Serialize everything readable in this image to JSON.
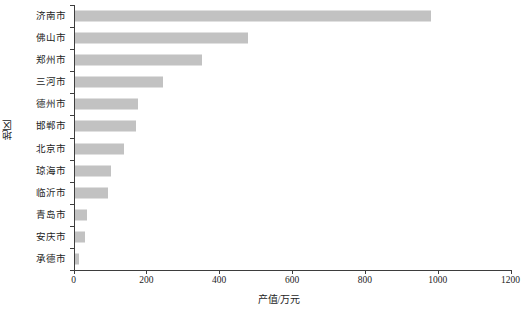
{
  "chart_data": {
    "type": "bar",
    "orientation": "horizontal",
    "title": "",
    "xlabel": "产值/万元",
    "ylabel": "地区",
    "categories": [
      "济南市",
      "佛山市",
      "郑州市",
      "三河市",
      "德州市",
      "邯郸市",
      "北京市",
      "琼海市",
      "临沂市",
      "青岛市",
      "安庆市",
      "承德市"
    ],
    "values": [
      979,
      477,
      349,
      242,
      173,
      168,
      135,
      100,
      93,
      33,
      30,
      13
    ],
    "xlim": [
      0,
      1200
    ],
    "xticks": [
      0,
      200,
      400,
      600,
      800,
      1000,
      1200
    ],
    "xtick_labels": [
      "0",
      "200",
      "400",
      "600",
      "800",
      "1000",
      "1200"
    ],
    "grid": false,
    "legend": null,
    "bar_color": "#c2c2c2",
    "axis_color": "#3d3d3d"
  }
}
